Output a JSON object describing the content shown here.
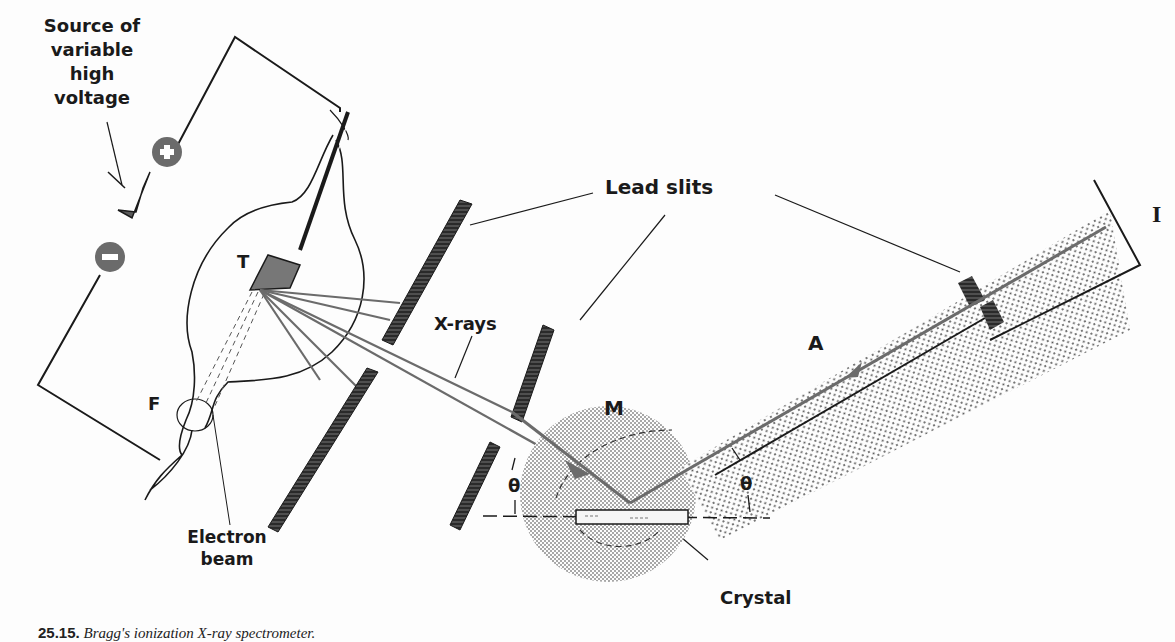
{
  "figure": {
    "caption_number": "25.15.",
    "caption_text": "Bragg's ionization X-ray spectrometer."
  },
  "labels": {
    "source": [
      "Source of",
      "variable",
      "high",
      "voltage"
    ],
    "voltage_symbol": "V",
    "plus": "+",
    "minus": "−",
    "target": "T",
    "filament": "F",
    "electron_beam": [
      "Electron",
      "beam"
    ],
    "lead_slits": "Lead slits",
    "xrays": "X-rays",
    "mount": "M",
    "theta_left": "θ",
    "theta_right": "θ",
    "crystal": "Crystal",
    "chamber": "A",
    "ionization": "I"
  },
  "colors": {
    "ink": "#1a1a1a",
    "gray_fill": "#6b6b6b",
    "screen_dot": "#9a9a9a",
    "background": "#fdfdfd"
  }
}
